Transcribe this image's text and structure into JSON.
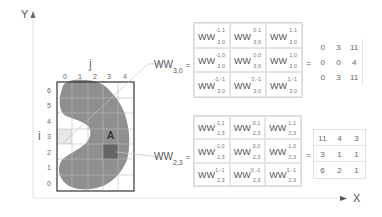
{
  "axes": {
    "y_label": "Y",
    "x_label": "X"
  },
  "grid": {
    "col_axis_label": "j",
    "row_axis_label": "i",
    "col_ticks": [
      "0",
      "1",
      "2",
      "3",
      "4"
    ],
    "row_ticks": [
      "6",
      "5",
      "4",
      "3",
      "2",
      "1",
      "0"
    ],
    "region_label": "A"
  },
  "windows": [
    {
      "name": "WW",
      "index": "3,0",
      "equals": "=",
      "cells": [
        {
          "sup": "-1,1",
          "sub": "3,0"
        },
        {
          "sup": "0,1",
          "sub": "3,0"
        },
        {
          "sup": "1,1",
          "sub": "3,0"
        },
        {
          "sup": "-1,0",
          "sub": "3,0"
        },
        {
          "sup": "0,0",
          "sub": "3,0"
        },
        {
          "sup": "1,0",
          "sub": "3,0"
        },
        {
          "sup": "-1,-1",
          "sub": "3,0"
        },
        {
          "sup": "0,-1",
          "sub": "3,0"
        },
        {
          "sup": "1,-1",
          "sub": "3,0"
        }
      ],
      "result": [
        "0",
        "3",
        "11",
        "0",
        "0",
        "4",
        "0",
        "3",
        "11"
      ]
    },
    {
      "name": "WW",
      "index": "2,3",
      "equals": "=",
      "cells": [
        {
          "sup": "-1,1",
          "sub": "2,3"
        },
        {
          "sup": "0,1",
          "sub": "2,3"
        },
        {
          "sup": "1,1",
          "sub": "2,3"
        },
        {
          "sup": "-1,0",
          "sub": "2,3"
        },
        {
          "sup": "0,0",
          "sub": "2,3"
        },
        {
          "sup": "1,0",
          "sub": "2,3"
        },
        {
          "sup": "-1,-1",
          "sub": "2,3"
        },
        {
          "sup": "0,-1",
          "sub": "2,3"
        },
        {
          "sup": "1,-1",
          "sub": "2,3"
        }
      ],
      "result": [
        "11",
        "4",
        "3",
        "3",
        "1",
        "1",
        "6",
        "2",
        "1"
      ]
    }
  ]
}
